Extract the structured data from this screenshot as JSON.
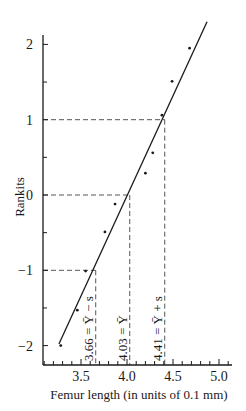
{
  "chart_data": {
    "type": "scatter",
    "title": "",
    "xlabel": "Femur length (in units of 0.1 mm)",
    "ylabel": "Rankits",
    "xlim": [
      3.09,
      5.14
    ],
    "ylim": [
      -2.45,
      2.35
    ],
    "x_ticks": [
      3.5,
      4.0,
      4.5,
      5.0
    ],
    "x_tick_labels": [
      "3.5",
      "4.0",
      "4.5",
      "5.0"
    ],
    "x_minor_step": 0.1,
    "y_ticks": [
      -2,
      -1,
      0,
      1,
      2
    ],
    "y_tick_labels": [
      "−2",
      "−1",
      "0",
      "1",
      "2"
    ],
    "y_minor_step": 0.5,
    "grid": false,
    "legend": null,
    "series": [
      {
        "name": "observations",
        "kind": "points",
        "x": [
          3.28,
          3.46,
          3.55,
          3.76,
          3.87,
          4.2,
          4.28,
          4.38,
          4.49,
          4.68
        ],
        "y": [
          -2.0,
          -1.53,
          -1.01,
          -0.49,
          -0.12,
          0.29,
          0.56,
          1.06,
          1.51,
          1.95
        ]
      },
      {
        "name": "fitted line",
        "kind": "line",
        "x": [
          3.26,
          4.87
        ],
        "y": [
          -1.98,
          2.3
        ]
      }
    ],
    "reference_lines": [
      {
        "orientation": "horizontal",
        "y": 1,
        "x_from": 3.09,
        "x_to": 4.41
      },
      {
        "orientation": "horizontal",
        "y": 0,
        "x_from": 3.09,
        "x_to": 4.03
      },
      {
        "orientation": "horizontal",
        "y": -1,
        "x_from": 3.09,
        "x_to": 3.66
      },
      {
        "orientation": "vertical",
        "x": 3.66,
        "y_from": -1,
        "label": "3.66 = Ȳ − s"
      },
      {
        "orientation": "vertical",
        "x": 4.03,
        "y_from": 0,
        "label": "4.03 = Ȳ"
      },
      {
        "orientation": "vertical",
        "x": 4.41,
        "y_from": 1,
        "label": "4.41 = Ȳ + s"
      }
    ]
  },
  "layout": {
    "plot_left_px": 43,
    "plot_bottom_px": 365,
    "x_ref": {
      "value": 4.0,
      "px": 127,
      "px_per_unit": 92
    },
    "y_ref": {
      "value": 0,
      "px": 195,
      "px_per_unit": 75.3
    },
    "x_axis_end_px": 232,
    "y_axis_top_px": 35,
    "colors": {
      "ink": "#1a1a1a",
      "dash": "#555555"
    }
  }
}
